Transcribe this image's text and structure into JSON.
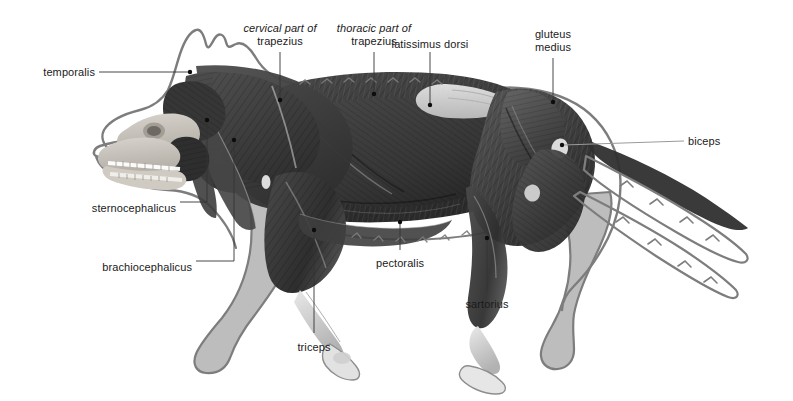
{
  "figure": {
    "background_color": "#ffffff",
    "silhouette_fill": "#bdbdbd",
    "silhouette_outline": "#7d7d7d",
    "muscle_dark": "#3a3a3a",
    "leader_color": "#333333",
    "leader_color_light": "#9a9a9a",
    "text_color": "#1a1a1a"
  },
  "labels": [
    {
      "id": "temporalis",
      "text": "temporalis",
      "align": "right",
      "x": 33,
      "y": 66,
      "leader": "horizontal-right",
      "dot": {
        "x": 190,
        "y": 72
      }
    },
    {
      "id": "cervical-part-of-trapezius",
      "text_italic": "cervical part of",
      "text_regular": "trapezius",
      "align": "center",
      "x": 244,
      "y": 22,
      "leader": "vertical-down",
      "dot": {
        "x": 280,
        "y": 100
      }
    },
    {
      "id": "thoracic-part-of-trapezius",
      "text_italic": "thoracic part of",
      "text_regular": "trapezius",
      "align": "center",
      "x": 338,
      "y": 22,
      "leader": "vertical-down",
      "dot": {
        "x": 374,
        "y": 94
      }
    },
    {
      "id": "latissimus-dorsi",
      "text": "latissimus dorsi",
      "align": "center",
      "x": 432,
      "y": 38,
      "leader": "vertical-down",
      "dot": {
        "x": 430,
        "y": 105
      }
    },
    {
      "id": "gluteus-medius",
      "text_line1": "gluteus",
      "text_line2": "medius",
      "align": "center",
      "x": 532,
      "y": 28,
      "leader": "vertical-down",
      "dot": {
        "x": 553,
        "y": 102
      }
    },
    {
      "id": "biceps",
      "text": "biceps",
      "align": "left",
      "x": 688,
      "y": 136,
      "leader": "horizontal-left-light",
      "dot": {
        "x": 562,
        "y": 145
      }
    },
    {
      "id": "sternocephalicus",
      "text": "sternocephalicus",
      "align": "right",
      "x": 86,
      "y": 202,
      "leader": "elbow-up-right",
      "dot": {
        "x": 207,
        "y": 120
      }
    },
    {
      "id": "brachiocephalicus",
      "text": "brachiocephalicus",
      "align": "right",
      "x": 103,
      "y": 261,
      "leader": "elbow-up-right",
      "dot": {
        "x": 234,
        "y": 140
      }
    },
    {
      "id": "triceps",
      "text": "triceps",
      "align": "center",
      "x": 295,
      "y": 342,
      "leader": "vertical-up",
      "dot": {
        "x": 314,
        "y": 230
      }
    },
    {
      "id": "pectoralis",
      "text": "pectoralis",
      "align": "center",
      "x": 408,
      "y": 258,
      "leader": "vertical-up",
      "dot": {
        "x": 400,
        "y": 222
      }
    },
    {
      "id": "sartorius",
      "text": "sartorius",
      "align": "center",
      "x": 468,
      "y": 299,
      "leader": "vertical-up",
      "dot": {
        "x": 487,
        "y": 238
      }
    }
  ]
}
